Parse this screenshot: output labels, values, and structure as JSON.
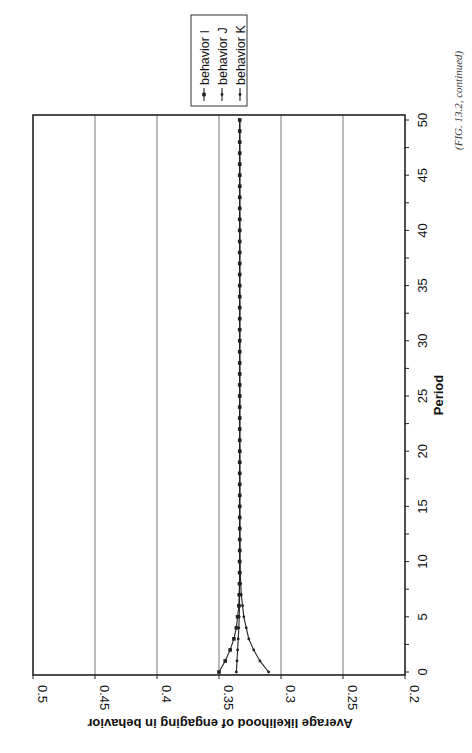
{
  "caption": "(FIG. 13.2, continued)",
  "chart_data": {
    "type": "line",
    "title": "",
    "xlabel": "Period",
    "ylabel": "Average likelihood of engaging in behavior",
    "xlim": [
      0,
      50
    ],
    "ylim": [
      0.2,
      0.5
    ],
    "x_ticks": [
      0,
      5,
      10,
      15,
      20,
      25,
      30,
      35,
      40,
      45,
      50
    ],
    "y_ticks": [
      "0.2",
      "0.25",
      "0.3",
      "0.35",
      "0.4",
      "0.45",
      "0.5"
    ],
    "grid": "horizontal gridlines at each y tick",
    "legend_position": "top-right (outside plot)",
    "orientation": "rotated 90 degrees counter-clockwise on page",
    "x": [
      0,
      1,
      2,
      3,
      4,
      5,
      6,
      7,
      8,
      9,
      10,
      11,
      12,
      13,
      14,
      15,
      16,
      17,
      18,
      19,
      20,
      21,
      22,
      23,
      24,
      25,
      26,
      27,
      28,
      29,
      30,
      31,
      32,
      33,
      34,
      35,
      36,
      37,
      38,
      39,
      40,
      41,
      42,
      43,
      44,
      45,
      46,
      47,
      48,
      49,
      50
    ],
    "series": [
      {
        "name": "behavior I",
        "marker": "square",
        "values": [
          0.35,
          0.345,
          0.341,
          0.338,
          0.336,
          0.335,
          0.334,
          0.3337,
          0.3335,
          0.3334,
          0.3334,
          0.3333,
          0.3333,
          0.3333,
          0.3333,
          0.3333,
          0.3333,
          0.3333,
          0.3333,
          0.3333,
          0.3333,
          0.3333,
          0.3333,
          0.3333,
          0.3333,
          0.3333,
          0.3333,
          0.3333,
          0.3333,
          0.3333,
          0.3333,
          0.3333,
          0.3333,
          0.3333,
          0.3333,
          0.3333,
          0.3333,
          0.3333,
          0.3333,
          0.3333,
          0.3333,
          0.3333,
          0.3333,
          0.3333,
          0.3333,
          0.3333,
          0.3333,
          0.3333,
          0.3333,
          0.3333,
          0.3333
        ]
      },
      {
        "name": "behavior J",
        "marker": "dot",
        "values": [
          0.336,
          0.3355,
          0.335,
          0.3345,
          0.334,
          0.3337,
          0.3335,
          0.3334,
          0.3334,
          0.3333,
          0.3333,
          0.3333,
          0.3333,
          0.3333,
          0.3333,
          0.3333,
          0.3333,
          0.3333,
          0.3333,
          0.3333,
          0.3333,
          0.3333,
          0.3333,
          0.3333,
          0.3333,
          0.3333,
          0.3333,
          0.3333,
          0.3333,
          0.3333,
          0.3333,
          0.3333,
          0.3333,
          0.3333,
          0.3333,
          0.3333,
          0.3333,
          0.3333,
          0.3333,
          0.3333,
          0.3333,
          0.3333,
          0.3333,
          0.3333,
          0.3333,
          0.3333,
          0.3333,
          0.3333,
          0.3333,
          0.3333,
          0.3333
        ]
      },
      {
        "name": "behavior K",
        "marker": "dot",
        "values": [
          0.31,
          0.317,
          0.322,
          0.326,
          0.328,
          0.33,
          0.331,
          0.332,
          0.3325,
          0.3328,
          0.333,
          0.3331,
          0.3332,
          0.3332,
          0.3333,
          0.3333,
          0.3333,
          0.3333,
          0.3333,
          0.3333,
          0.3333,
          0.3333,
          0.3333,
          0.3333,
          0.3333,
          0.3333,
          0.3333,
          0.3333,
          0.3333,
          0.3333,
          0.3333,
          0.3333,
          0.3333,
          0.3333,
          0.3333,
          0.3333,
          0.3333,
          0.3333,
          0.3333,
          0.3333,
          0.3333,
          0.3333,
          0.3333,
          0.3333,
          0.3333,
          0.3333,
          0.3333,
          0.3333,
          0.3333,
          0.3333,
          0.3333
        ]
      }
    ]
  },
  "style": {
    "line_color": "#222222",
    "grid_color": "#777777",
    "frame_color": "#222222",
    "background": "#ffffff"
  }
}
